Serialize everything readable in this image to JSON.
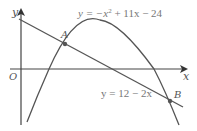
{
  "diagram": {
    "axes": {
      "x_label": "x",
      "y_label": "y",
      "origin_label": "O"
    },
    "curves": [
      {
        "name": "parabola",
        "equation": "y = −x² + 11x − 24",
        "eq_prefix": "y = −x",
        "eq_exp": "2",
        "eq_suffix": " + 11x − 24"
      },
      {
        "name": "line",
        "equation": "y = 12 − 2x"
      }
    ],
    "points": [
      {
        "label": "A"
      },
      {
        "label": "B"
      }
    ],
    "colors": {
      "stroke": "#555555",
      "point": "#555555"
    }
  }
}
